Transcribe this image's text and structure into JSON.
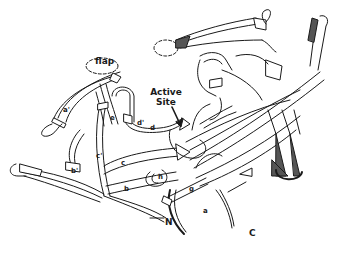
{
  "diagram": {
    "type": "protein ribbon diagram",
    "annotations": {
      "flap": "flap",
      "active_site_line1": "Active",
      "active_site_line2": "Site"
    },
    "strand_labels": {
      "a_prime": "a'",
      "b_prime": "b'",
      "c_prime": "c'",
      "c": "c",
      "b": "b",
      "d": "d",
      "d_prime": "d'",
      "e": "e",
      "h": "h",
      "g": "g",
      "a": "a"
    },
    "termini": {
      "n": "N",
      "c": "C"
    },
    "colors": {
      "ink": "#1a1a1a",
      "fill": "#ffffff",
      "shaded": "#555555"
    }
  }
}
